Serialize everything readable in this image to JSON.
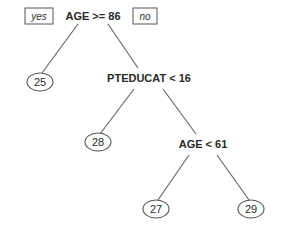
{
  "tree": {
    "root": {
      "label": "AGE >= 86",
      "yes_label": "yes",
      "no_label": "no"
    },
    "nodes": {
      "leaf_25": "25",
      "split_pteducat": "PTEDUCAT < 16",
      "leaf_28": "28",
      "split_age61": "AGE < 61",
      "leaf_27": "27",
      "leaf_29": "29"
    }
  },
  "colors": {
    "text": "#2a2a2a",
    "edge": "#6a6a6a",
    "background": "#ffffff"
  }
}
